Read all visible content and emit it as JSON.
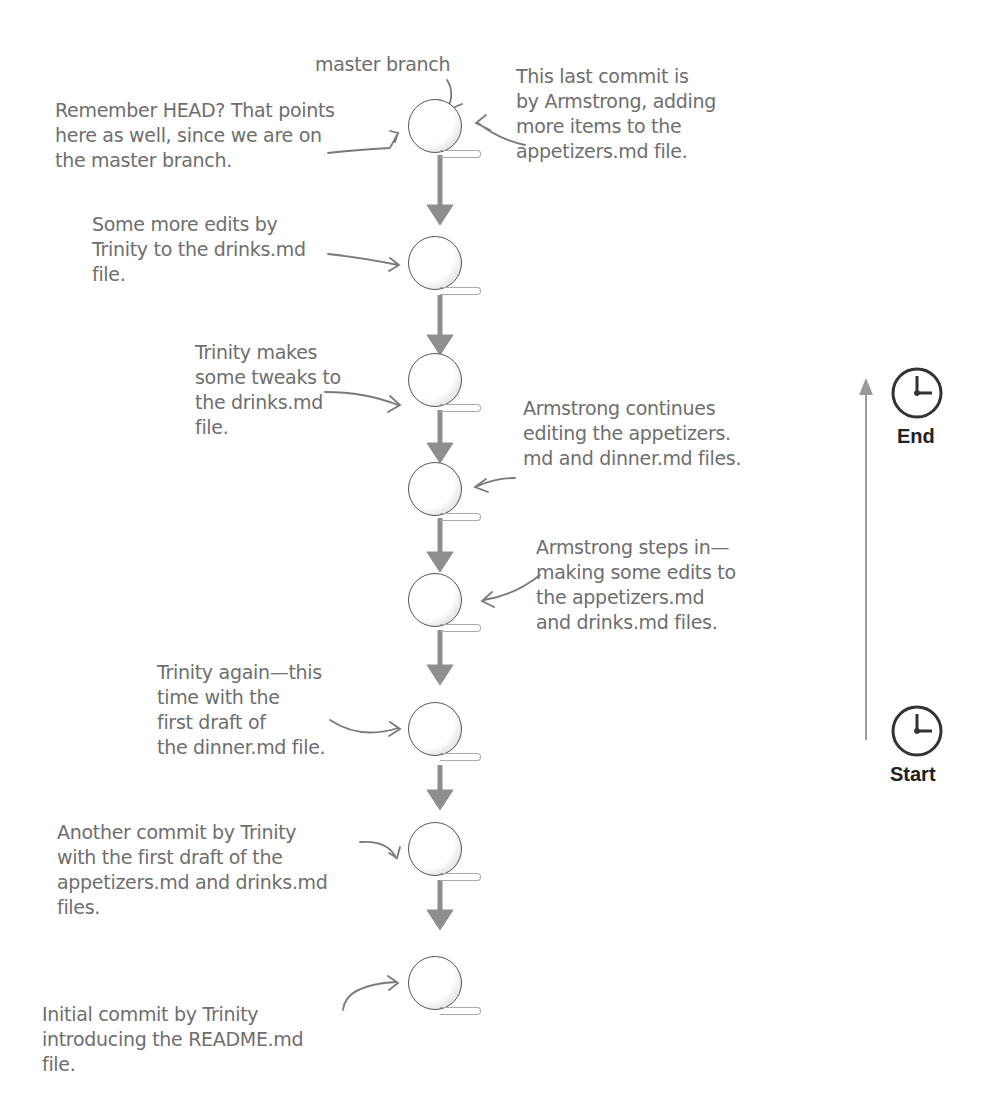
{
  "diagram": {
    "type": "git-commit-history",
    "branch_label": "master branch",
    "commits": [
      {
        "index": 8,
        "annotation": "This last commit is\nby Armstrong, adding\nmore items to the\nappetizers.md file."
      },
      {
        "index": 7,
        "annotation": "Some more edits by\nTrinity to the drinks.md\nfile."
      },
      {
        "index": 6,
        "annotation": "Trinity makes\nsome tweaks to\nthe drinks.md\nfile."
      },
      {
        "index": 5,
        "annotation": "Armstrong continues\nediting the appetizers.\nmd and dinner.md files."
      },
      {
        "index": 4,
        "annotation": "Armstrong steps in—\nmaking some edits to\nthe appetizers.md\nand drinks.md files."
      },
      {
        "index": 3,
        "annotation": "Trinity again—this\ntime with the\nfirst draft of\nthe dinner.md file."
      },
      {
        "index": 2,
        "annotation": "Another commit by Trinity\nwith the first draft of the\nappetizers.md and drinks.md\nfiles."
      },
      {
        "index": 1,
        "annotation": "Initial commit by Trinity\nintroducing the README.md\nfile."
      }
    ],
    "head_note": "Remember HEAD? That points\nhere as well, since we are on\nthe master branch.",
    "timeline": {
      "end_label": "End",
      "start_label": "Start"
    }
  }
}
